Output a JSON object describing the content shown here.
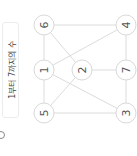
{
  "label": {
    "text": "1부터 7까지의 수"
  },
  "graph": {
    "nodes": [
      {
        "id": "6",
        "label": "6",
        "x": 44,
        "y": 25
      },
      {
        "id": "4",
        "label": "4",
        "x": 126,
        "y": 25
      },
      {
        "id": "1",
        "label": "1",
        "x": 44,
        "y": 70
      },
      {
        "id": "2",
        "label": "2",
        "x": 82,
        "y": 70
      },
      {
        "id": "7",
        "label": "7",
        "x": 126,
        "y": 70
      },
      {
        "id": "5",
        "label": "5",
        "x": 44,
        "y": 113
      },
      {
        "id": "3",
        "label": "3",
        "x": 126,
        "y": 113
      }
    ],
    "edges": [
      [
        "6",
        "4"
      ],
      [
        "6",
        "1"
      ],
      [
        "6",
        "2"
      ],
      [
        "1",
        "4"
      ],
      [
        "1",
        "5"
      ],
      [
        "1",
        "3"
      ],
      [
        "2",
        "7"
      ],
      [
        "2",
        "5"
      ],
      [
        "7",
        "4"
      ],
      [
        "7",
        "3"
      ],
      [
        "5",
        "3"
      ]
    ],
    "node_radius": 10,
    "colors": {
      "node_stroke": "#d9d9d9",
      "edge": "#dcdcdc",
      "text": "#555555"
    }
  }
}
